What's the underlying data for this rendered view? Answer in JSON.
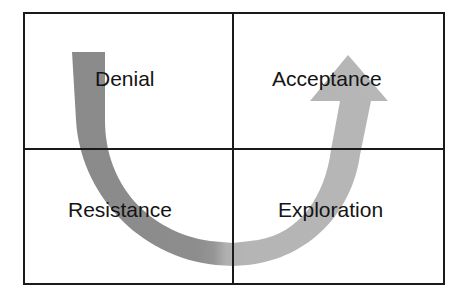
{
  "diagram": {
    "type": "quadrant-change-curve",
    "background_color": "#ffffff",
    "frame": {
      "name": "outer-rectangle",
      "color": "#1a1a1a",
      "stroke_width": 2,
      "x": 23,
      "y": 12,
      "width": 422,
      "height": 273
    },
    "divider_lines": {
      "vertical": {
        "name": "vertical-divider",
        "x": 233,
        "color": "#1a1a1a",
        "stroke_width": 2
      },
      "horizontal": {
        "name": "horizontal-divider",
        "y": 149,
        "color": "#1a1a1a",
        "stroke_width": 2
      }
    },
    "quadrants": [
      {
        "id": "top-left",
        "label": "Denial",
        "position": "top-left"
      },
      {
        "id": "top-right",
        "label": "Acceptance",
        "position": "top-right"
      },
      {
        "id": "bottom-left",
        "label": "Resistance",
        "position": "bottom-left"
      },
      {
        "id": "bottom-right",
        "label": "Exploration",
        "position": "bottom-right"
      }
    ],
    "arrow": {
      "name": "u-curve-arrow",
      "shape": "u-shaped-curve-with-arrowhead",
      "direction": "from top-left down through bottom-center up to top-right",
      "dark_segment_color": "#8a8a8a",
      "light_segment_color": "#b5b5b5",
      "tail": {
        "x": 72,
        "y": 52,
        "width": 33
      },
      "trough": {
        "x": 233,
        "y": 247
      },
      "head_apex": {
        "x": 348,
        "y": 55
      },
      "head_wing_left_x": 310,
      "head_wing_right_x": 388,
      "head_wing_y": 100
    },
    "text_color": "#141414",
    "label_font_size_px": 21
  }
}
